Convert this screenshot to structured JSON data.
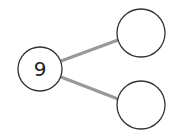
{
  "diagram": {
    "type": "number-bond",
    "whole": {
      "value": "9"
    },
    "parts": [
      {
        "value": ""
      },
      {
        "value": ""
      }
    ],
    "colors": {
      "circle_stroke": "#333333",
      "connector": "#999999",
      "background": "#ffffff"
    }
  }
}
